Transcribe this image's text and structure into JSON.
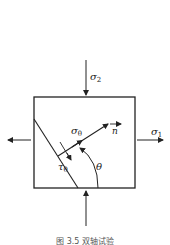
{
  "figure": {
    "caption": "图 3.5   双轴试验",
    "labels": {
      "sigma2": "σ",
      "sigma2_sub": "2",
      "sigma1": "σ",
      "sigma1_sub": "1",
      "sigma_theta": "σ",
      "sigma_theta_sub": "θ",
      "tau_theta": "τ",
      "tau_theta_sub": "θ",
      "normal": "n",
      "angle": "θ"
    },
    "colors": {
      "line": "#222222",
      "background": "#ffffff"
    }
  }
}
